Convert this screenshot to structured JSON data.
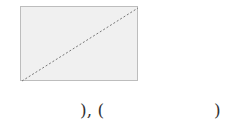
{
  "diagram": {
    "shape": "rectangle",
    "fill": "#f0f0f0",
    "border_color": "#bdbdbd",
    "diagonal": {
      "style": "dashed",
      "color": "#777777",
      "from": "bottom-left",
      "to": "top-right"
    }
  },
  "answer_line": {
    "left_part": "), (",
    "right_part": ")"
  }
}
